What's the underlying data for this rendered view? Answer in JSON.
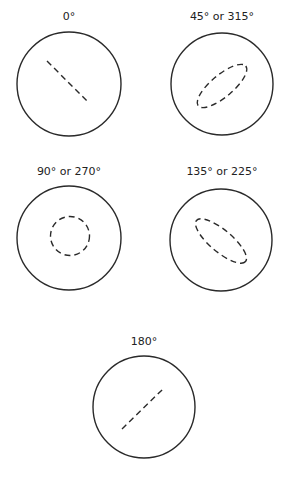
{
  "figure": {
    "panels": [
      {
        "label": "0°",
        "pattern": "line",
        "orientation": "descending"
      },
      {
        "label": "45° or 315°",
        "pattern": "ellipse",
        "orientation": "ascending"
      },
      {
        "label": "90° or 270°",
        "pattern": "circle",
        "orientation": "none"
      },
      {
        "label": "135° or 225°",
        "pattern": "ellipse",
        "orientation": "descending"
      },
      {
        "label": "180°",
        "pattern": "line",
        "orientation": "ascending"
      }
    ]
  }
}
